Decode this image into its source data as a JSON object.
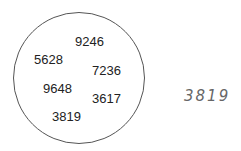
{
  "circle": {
    "numbers": [
      {
        "value": "9246",
        "x": 75,
        "y": 35
      },
      {
        "value": "5628",
        "x": 34,
        "y": 53
      },
      {
        "value": "7236",
        "x": 92,
        "y": 64
      },
      {
        "value": "9648",
        "x": 43,
        "y": 82
      },
      {
        "value": "3617",
        "x": 92,
        "y": 92
      },
      {
        "value": "3819",
        "x": 52,
        "y": 110
      }
    ]
  },
  "answer": {
    "handwritten": "3819"
  }
}
